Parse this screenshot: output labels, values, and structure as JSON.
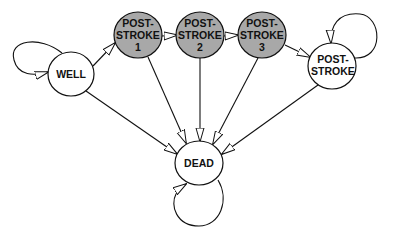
{
  "diagram": {
    "title": "",
    "colors": {
      "background": "#ffffff",
      "node_fill_plain": "#ffffff",
      "node_fill_shaded": "#a8a8a8",
      "stroke": "#111111",
      "arrowhead_fill": "#ffffff"
    },
    "nodes": [
      {
        "id": "well",
        "lines": [
          "WELL"
        ],
        "shaded": false
      },
      {
        "id": "ps1",
        "lines": [
          "POST-",
          "STROKE",
          "1"
        ],
        "shaded": true
      },
      {
        "id": "ps2",
        "lines": [
          "POST-",
          "STROKE",
          "2"
        ],
        "shaded": true
      },
      {
        "id": "ps3",
        "lines": [
          "POST-",
          "STROKE",
          "3"
        ],
        "shaded": true
      },
      {
        "id": "ps",
        "lines": [
          "POST-",
          "STROKE"
        ],
        "shaded": false
      },
      {
        "id": "dead",
        "lines": [
          "DEAD"
        ],
        "shaded": false
      }
    ],
    "edges": [
      {
        "from": "well",
        "to": "well",
        "type": "self-loop"
      },
      {
        "from": "well",
        "to": "ps1"
      },
      {
        "from": "ps1",
        "to": "ps2"
      },
      {
        "from": "ps2",
        "to": "ps3"
      },
      {
        "from": "ps3",
        "to": "ps"
      },
      {
        "from": "ps",
        "to": "ps",
        "type": "self-loop"
      },
      {
        "from": "well",
        "to": "dead"
      },
      {
        "from": "ps1",
        "to": "dead"
      },
      {
        "from": "ps2",
        "to": "dead"
      },
      {
        "from": "ps3",
        "to": "dead"
      },
      {
        "from": "ps",
        "to": "dead"
      },
      {
        "from": "dead",
        "to": "dead",
        "type": "self-loop"
      }
    ]
  }
}
